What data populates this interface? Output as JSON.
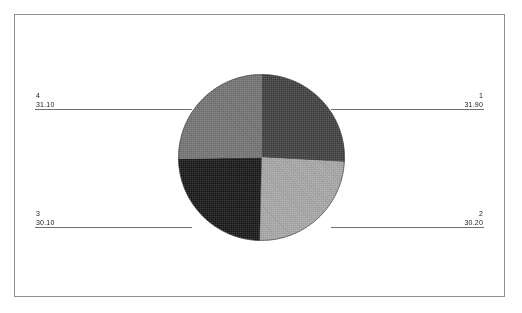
{
  "figure": {
    "background_color": "#ffffff",
    "frame_color": "#8f8f8f",
    "leader_line_color": "#6f6f6f"
  },
  "labels": {
    "slice1": {
      "index": "1",
      "value": "31.90"
    },
    "slice2": {
      "index": "2",
      "value": "30.20"
    },
    "slice3": {
      "index": "3",
      "value": "30.10"
    },
    "slice4": {
      "index": "4",
      "value": "31.10"
    }
  },
  "chart_data": {
    "type": "pie",
    "title": "",
    "xlabel": "",
    "ylabel": "",
    "categories": [
      "1",
      "2",
      "3",
      "4"
    ],
    "values": [
      31.9,
      30.2,
      30.1,
      31.1
    ],
    "value_labels": [
      "31.90",
      "30.20",
      "30.10",
      "31.10"
    ],
    "total": 123.3,
    "percentages": [
      25.9,
      24.5,
      24.4,
      25.2
    ],
    "slice_colors": [
      "#3a3a3a",
      "#a2a2a2",
      "#121212",
      "#6e6e6e"
    ],
    "slice_order": "clockwise from 12 o'clock",
    "slices": [
      {
        "label": "1",
        "value": 31.9,
        "color": "#3a3a3a",
        "position": "top-right",
        "start_angle_deg": 0,
        "end_angle_deg": 93
      },
      {
        "label": "2",
        "value": 30.2,
        "color": "#a2a2a2",
        "position": "bottom-right",
        "start_angle_deg": 93,
        "end_angle_deg": 181
      },
      {
        "label": "3",
        "value": 30.1,
        "color": "#121212",
        "position": "bottom-left",
        "start_angle_deg": 181,
        "end_angle_deg": 269
      },
      {
        "label": "4",
        "value": 31.1,
        "color": "#6e6e6e",
        "position": "top-left",
        "start_angle_deg": 269,
        "end_angle_deg": 360
      }
    ],
    "legend": null,
    "legend_position": "callout labels at figure corners",
    "grid": false,
    "annotations": [
      "Leader lines connect each corner label to its pie slice",
      "Each value is underlined"
    ]
  }
}
